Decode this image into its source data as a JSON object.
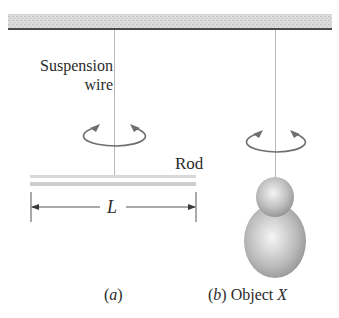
{
  "figure": {
    "panel_a": {
      "caption": "(a)",
      "caption_open": "(",
      "caption_letter": "a",
      "caption_close": ")",
      "wire_label_line1": "Suspension",
      "wire_label_line2": "wire",
      "rod_label": "Rod",
      "length_label": "L"
    },
    "panel_b": {
      "caption_open": "(",
      "caption_letter": "b",
      "caption_close": ")",
      "object_word": "Object",
      "object_name": "X"
    },
    "colors": {
      "ceiling_hatch": "#d4d4d4",
      "ceiling_edge": "#4a4a4a",
      "wire": "#b8b8b8",
      "rotation_arrow": "#6e6e6e",
      "rod": "#cfcfcf",
      "dimension_line": "#555555",
      "object_shade": "#9a9a9a"
    }
  }
}
